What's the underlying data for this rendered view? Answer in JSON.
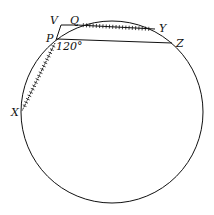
{
  "diagram": {
    "type": "geometry-circle",
    "labels": {
      "V": "V",
      "Q": "Q",
      "Y": "Y",
      "P": "P",
      "Z": "Z",
      "X": "X",
      "angle": "120°"
    },
    "circle": {
      "cx": 112,
      "cy": 112,
      "r": 91
    },
    "points": {
      "V": [
        61,
        25
      ],
      "Q": [
        77,
        25
      ],
      "Y": [
        155,
        29
      ],
      "P": [
        57,
        39
      ],
      "Z": [
        172,
        43
      ],
      "X": [
        22,
        111
      ]
    },
    "segments": [
      {
        "from": "V",
        "to": "Q",
        "hatched": false
      },
      {
        "from": "V",
        "to": "P",
        "hatched": false
      },
      {
        "from": "Q",
        "to": "Y",
        "hatched": true
      },
      {
        "from": "P",
        "to": "Z",
        "hatched": false
      },
      {
        "from": "P",
        "to": "X",
        "hatched": true
      }
    ],
    "angle_at_P": "120°",
    "line_color": "#111111"
  }
}
